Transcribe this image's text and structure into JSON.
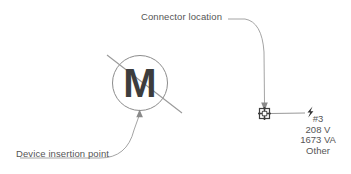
{
  "diagram": {
    "background_color": "#ffffff",
    "line_color": "#8c8c8c",
    "text_color": "#555555",
    "symbol_color": "#3d3d3d",
    "annotations": {
      "connector_location_label": "Connector location",
      "device_insertion_point_label": "Device insertion point"
    },
    "motor_symbol": {
      "letter": "M",
      "name": "motor-symbol"
    },
    "connector_symbol": {
      "name": "connector-node",
      "icon": "crossed-square-icon"
    },
    "power_icon": "lightning-bolt-icon",
    "connector_info": {
      "lines": [
        "#3",
        "208 V",
        "1673 VA",
        "Other"
      ],
      "designation": "#3",
      "voltage": "208 V",
      "apparent_power": "1673 VA",
      "type": "Other"
    }
  }
}
